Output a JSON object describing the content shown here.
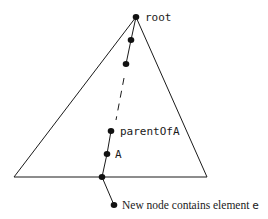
{
  "diagram": {
    "type": "tree-insertion-path",
    "labels": {
      "root": "root",
      "parent": "parentOfA",
      "a": "A",
      "new_node_prefix": "New node contains element ",
      "new_node_element": "e"
    },
    "colors": {
      "stroke": "#1a1a1a",
      "node": "#111111",
      "background": "#ffffff"
    }
  }
}
